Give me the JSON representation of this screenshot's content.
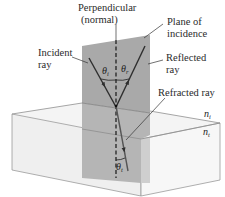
{
  "diagram": {
    "labels": {
      "normal_line1": "Perpendicular",
      "normal_line2": "(normal)",
      "plane_line1": "Plane of",
      "plane_line2": "incidence",
      "incident_line1": "Incident",
      "incident_line2": "ray",
      "reflected_line1": "Reflected",
      "reflected_line2": "ray",
      "refracted": "Refracted ray"
    },
    "symbols": {
      "theta": "θ",
      "theta_i_sub": "i",
      "theta_r_sub": "r",
      "theta_t_sub": "t",
      "n": "n",
      "n_i_sub": "i",
      "n_t_sub": "t"
    },
    "colors": {
      "plane_fill": "#a9a9a9",
      "plane_lower_fill": "#b8b8b8",
      "box_edge": "#8a8a8a",
      "box_front": "#efefef",
      "box_top": "#f6f6f6",
      "ray": "#3a3a3a"
    }
  }
}
